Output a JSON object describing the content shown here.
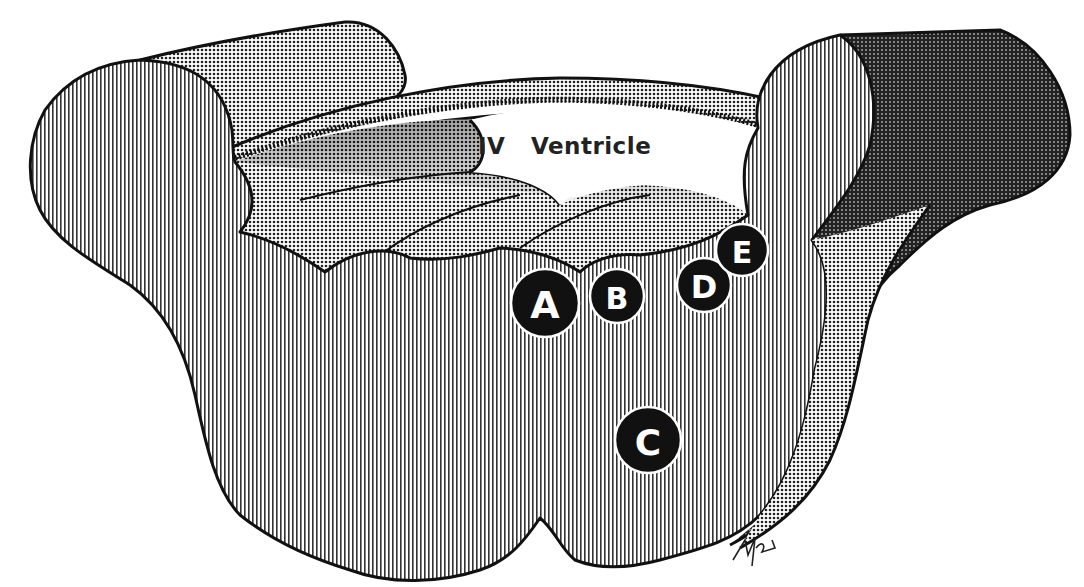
{
  "diagram": {
    "title_label": "IV   Ventricle",
    "markers": [
      {
        "id": "A",
        "label": "A",
        "cx": 545,
        "cy": 303,
        "r": 34
      },
      {
        "id": "B",
        "label": "B",
        "cx": 617,
        "cy": 296,
        "r": 27
      },
      {
        "id": "C",
        "label": "C",
        "cx": 648,
        "cy": 440,
        "r": 33
      },
      {
        "id": "D",
        "label": "D",
        "cx": 704,
        "cy": 285,
        "r": 27
      },
      {
        "id": "E",
        "label": "E",
        "cx": 742,
        "cy": 250,
        "r": 26
      }
    ],
    "signature": "MW",
    "colors": {
      "ink": "#111111",
      "paper": "#ffffff",
      "hatch_light": "#555555",
      "halftone_dark": "#222222"
    }
  }
}
